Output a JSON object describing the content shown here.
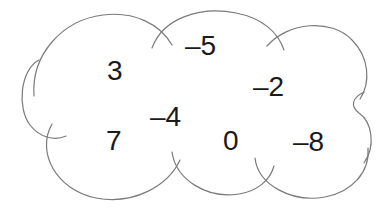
{
  "canvas": {
    "width": 392,
    "height": 213,
    "background": "#ffffff"
  },
  "figure": {
    "shape_name": "cloud-outline",
    "stroke_color": "#7a7a7a",
    "stroke_width": 1.2,
    "fill": "#ffffff"
  },
  "numbers": [
    {
      "id": "num-3",
      "label": "3",
      "value": 3,
      "x": 107,
      "y": 57,
      "size": 28
    },
    {
      "id": "num-minus-5",
      "label": "–5",
      "value": -5,
      "x": 185,
      "y": 32,
      "size": 28
    },
    {
      "id": "num-minus-2",
      "label": "–2",
      "value": -2,
      "x": 253,
      "y": 73,
      "size": 28
    },
    {
      "id": "num-minus-4",
      "label": "–4",
      "value": -4,
      "x": 150,
      "y": 103,
      "size": 28
    },
    {
      "id": "num-7",
      "label": "7",
      "value": 7,
      "x": 106,
      "y": 127,
      "size": 28
    },
    {
      "id": "num-0",
      "label": "0",
      "value": 0,
      "x": 223,
      "y": 127,
      "size": 28
    },
    {
      "id": "num-minus-8",
      "label": "–8",
      "value": -8,
      "x": 293,
      "y": 128,
      "size": 28
    }
  ]
}
